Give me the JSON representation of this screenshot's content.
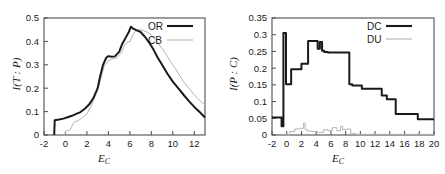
{
  "figure": {
    "background": "#ffffff",
    "panels": [
      "left",
      "right"
    ]
  },
  "left_panel": {
    "xlabel": "E",
    "xlabel_sub": "C",
    "ylabel": "I(T : P)",
    "legend": [
      {
        "label": "OR",
        "color": "#1a1a1a",
        "width": 2.1
      },
      {
        "label": "CB",
        "color": "#b3b3b3",
        "width": 1.1
      }
    ],
    "xticks": [
      "-2",
      "0",
      "2",
      "4",
      "6",
      "8",
      "10",
      "12"
    ],
    "yticks": [
      "0",
      "0.1",
      "0.2",
      "0.3",
      "0.4",
      "0.5"
    ]
  },
  "right_panel": {
    "xlabel": "E",
    "xlabel_sub": "C",
    "ylabel": "I(P : C)",
    "legend": [
      {
        "label": "DC",
        "color": "#1a1a1a",
        "width": 2.1
      },
      {
        "label": "DU",
        "color": "#b3b3b3",
        "width": 1.1
      }
    ],
    "xticks": [
      "-2",
      "0",
      "2",
      "4",
      "6",
      "8",
      "10",
      "12",
      "14",
      "16",
      "18",
      "20"
    ],
    "yticks": [
      "0",
      "0.05",
      "0.1",
      "0.15",
      "0.2",
      "0.25",
      "0.3",
      "0.35"
    ]
  },
  "chart_data": [
    {
      "type": "line",
      "panel": "left",
      "title": "",
      "xlabel": "E_C",
      "ylabel": "I(T : P)",
      "xlim": [
        -2,
        13
      ],
      "ylim": [
        0,
        0.5
      ],
      "xtick_values": [
        -2,
        0,
        2,
        4,
        6,
        8,
        10,
        12
      ],
      "ytick_values": [
        0,
        0.1,
        0.2,
        0.3,
        0.4,
        0.5
      ],
      "grid": false,
      "legend_position": "top-right",
      "series": [
        {
          "name": "OR",
          "color": "#1a1a1a",
          "x": [
            -1.05,
            -1.0,
            -0.6,
            -0.2,
            0.2,
            0.6,
            1.0,
            1.4,
            1.8,
            2.2,
            2.6,
            3.0,
            3.2,
            3.5,
            3.8,
            4.0,
            4.3,
            4.6,
            5.0,
            5.3,
            5.6,
            5.9,
            6.1,
            6.3,
            6.6,
            7.0,
            7.4,
            7.8,
            8.2,
            8.6,
            9.0,
            9.5,
            10.0,
            10.5,
            11.0,
            11.5,
            12.0,
            12.5,
            13.0
          ],
          "y": [
            0.0,
            0.063,
            0.066,
            0.07,
            0.076,
            0.082,
            0.09,
            0.098,
            0.112,
            0.13,
            0.158,
            0.2,
            0.245,
            0.3,
            0.33,
            0.337,
            0.334,
            0.336,
            0.355,
            0.39,
            0.415,
            0.44,
            0.463,
            0.455,
            0.448,
            0.44,
            0.42,
            0.395,
            0.365,
            0.33,
            0.3,
            0.262,
            0.228,
            0.2,
            0.172,
            0.145,
            0.12,
            0.098,
            0.075
          ]
        },
        {
          "name": "CB",
          "color": "#b3b3b3",
          "x": [
            -0.05,
            0.0,
            0.4,
            0.8,
            1.2,
            1.6,
            2.0,
            2.4,
            2.8,
            3.2,
            3.6,
            4.0,
            4.4,
            4.8,
            5.2,
            5.5,
            5.8,
            6.0,
            6.3,
            6.6,
            7.0,
            7.3,
            7.6,
            8.0,
            8.5,
            9.0,
            9.5,
            10.0,
            10.5,
            11.0,
            11.5,
            12.0,
            12.5,
            13.0
          ],
          "y": [
            0.0,
            0.017,
            0.02,
            0.055,
            0.062,
            0.075,
            0.09,
            0.125,
            0.17,
            0.225,
            0.295,
            0.318,
            0.325,
            0.33,
            0.352,
            0.383,
            0.398,
            0.398,
            0.43,
            0.448,
            0.45,
            0.445,
            0.44,
            0.428,
            0.4,
            0.37,
            0.335,
            0.3,
            0.265,
            0.228,
            0.2,
            0.172,
            0.148,
            0.128
          ]
        }
      ]
    },
    {
      "type": "line",
      "panel": "right",
      "title": "",
      "xlabel": "E_C",
      "ylabel": "I(P : C)",
      "xlim": [
        -2,
        20
      ],
      "ylim": [
        0,
        0.35
      ],
      "xtick_values": [
        -2,
        0,
        2,
        4,
        6,
        8,
        10,
        12,
        14,
        16,
        18,
        20
      ],
      "ytick_values": [
        0,
        0.05,
        0.1,
        0.15,
        0.2,
        0.25,
        0.3,
        0.35
      ],
      "grid": false,
      "legend_position": "top-right",
      "series": [
        {
          "name": "DC",
          "color": "#1a1a1a",
          "step": true,
          "x": [
            -2.0,
            -0.7,
            -0.7,
            -0.45,
            -0.45,
            -0.1,
            -0.1,
            0.6,
            0.6,
            2.0,
            2.0,
            2.9,
            2.9,
            4.2,
            4.2,
            4.5,
            4.5,
            4.8,
            4.8,
            5.1,
            5.1,
            5.6,
            5.6,
            8.5,
            8.5,
            8.9,
            8.9,
            10.2,
            10.2,
            12.9,
            12.9,
            13.6,
            13.6,
            14.8,
            14.8,
            17.8,
            17.8,
            20.0
          ],
          "y": [
            0.052,
            0.052,
            0.026,
            0.026,
            0.305,
            0.305,
            0.152,
            0.152,
            0.197,
            0.197,
            0.213,
            0.213,
            0.281,
            0.281,
            0.258,
            0.258,
            0.278,
            0.278,
            0.252,
            0.252,
            0.248,
            0.248,
            0.247,
            0.247,
            0.152,
            0.152,
            0.148,
            0.148,
            0.138,
            0.138,
            0.118,
            0.118,
            0.107,
            0.107,
            0.063,
            0.063,
            0.047,
            0.047
          ]
        },
        {
          "name": "DU",
          "color": "#b3b3b3",
          "step": true,
          "x": [
            -0.2,
            0.4,
            0.4,
            1.1,
            1.1,
            1.8,
            1.8,
            2.3,
            2.3,
            2.5,
            2.5,
            2.8,
            2.8,
            3.4,
            3.4,
            4.2,
            4.2,
            5.0,
            5.0,
            5.6,
            5.6,
            6.2,
            6.2,
            6.8,
            6.8,
            7.3,
            7.3,
            7.6,
            7.6,
            8.2,
            8.2,
            8.7,
            8.7,
            9.4,
            9.4,
            20.0
          ],
          "y": [
            0.0,
            0.0,
            0.01,
            0.01,
            0.018,
            0.018,
            0.02,
            0.02,
            0.036,
            0.036,
            0.016,
            0.016,
            0.012,
            0.012,
            0.01,
            0.01,
            0.008,
            0.008,
            0.016,
            0.016,
            0.013,
            0.013,
            0.022,
            0.022,
            0.013,
            0.013,
            0.026,
            0.026,
            0.016,
            0.016,
            0.018,
            0.018,
            0.004,
            0.004,
            0.002,
            0.002
          ]
        }
      ]
    }
  ]
}
